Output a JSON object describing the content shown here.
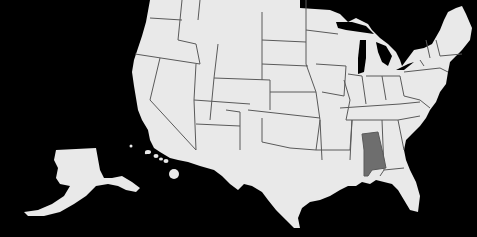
{
  "map": {
    "title": "United States",
    "background_color": "#000000",
    "land_color": "#e9e9e9",
    "border_color": "#5a5a5a",
    "highlighted_state": {
      "name": "Alabama",
      "color": "#6e6e6e"
    },
    "regions_shown": [
      "Contiguous United States",
      "Alaska",
      "Hawaii"
    ]
  }
}
